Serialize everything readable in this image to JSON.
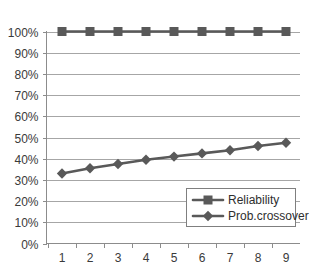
{
  "chart_data": {
    "type": "line",
    "title": "",
    "xlabel": "",
    "ylabel": "",
    "x": [
      1,
      2,
      3,
      4,
      5,
      6,
      7,
      8,
      9
    ],
    "categories": [
      "1",
      "2",
      "3",
      "4",
      "5",
      "6",
      "7",
      "8",
      "9"
    ],
    "series": [
      {
        "name": "Reliability",
        "marker": "square",
        "color": "#595959",
        "values": [
          100,
          100,
          100,
          100,
          100,
          100,
          100,
          100,
          100
        ]
      },
      {
        "name": "Prob.crossover",
        "marker": "diamond",
        "color": "#595959",
        "values": [
          33,
          35.5,
          37.5,
          39.5,
          41,
          42.5,
          44,
          46,
          47.5
        ]
      }
    ],
    "ylim": [
      0,
      100
    ],
    "ytick_values": [
      0,
      10,
      20,
      30,
      40,
      50,
      60,
      70,
      80,
      90,
      100
    ],
    "ytick_labels": [
      "0%",
      "10%",
      "20%",
      "30%",
      "40%",
      "50%",
      "60%",
      "70%",
      "80%",
      "90%",
      "100%"
    ],
    "xtick_labels": [
      "1",
      "2",
      "3",
      "4",
      "5",
      "6",
      "7",
      "8",
      "9"
    ],
    "grid": true,
    "grid_axis": "y",
    "legend_position": "inside-lower-right",
    "legend_entries": [
      "Reliability",
      "Prob.crossover"
    ],
    "value_suffix": "%"
  },
  "colors": {
    "series": "#595959",
    "gridline": "#a6a6a6",
    "axis": "#8c8c8c",
    "text": "#3a3a3a",
    "background": "#ffffff",
    "legend_border": "#7f7f7f"
  }
}
